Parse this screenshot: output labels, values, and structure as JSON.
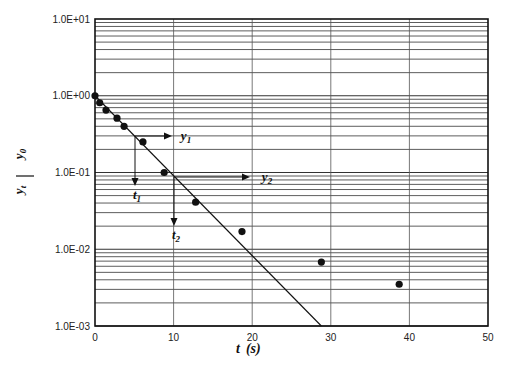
{
  "chart_data": {
    "type": "scatter",
    "title": "",
    "xlabel": "t (s)",
    "ylabel": "y_t / y_0",
    "xscale": "linear",
    "yscale": "log",
    "xlim": [
      0,
      50
    ],
    "ylim": [
      0.001,
      10
    ],
    "grid": true,
    "legend": null,
    "x_ticks": [
      "0",
      "10",
      "20",
      "30",
      "40",
      "50"
    ],
    "y_ticks": [
      "1.0E-03",
      "1.0E-02",
      "1.0E-01",
      "1.0E+00",
      "1.0E+01"
    ],
    "series": [
      {
        "name": "measured",
        "kind": "scatter",
        "x": [
          0,
          0.6,
          1.4,
          2.8,
          3.7,
          6.1,
          8.8,
          12.8,
          18.7,
          28.8,
          38.7
        ],
        "y": [
          1.0,
          0.81,
          0.65,
          0.51,
          0.4,
          0.25,
          0.1,
          0.041,
          0.017,
          0.0068,
          0.0035
        ]
      },
      {
        "name": "fitted line",
        "kind": "line",
        "x": [
          0,
          28.8
        ],
        "y": [
          1.0,
          0.001
        ]
      }
    ],
    "annotations": [
      {
        "label": "y",
        "sub": "1",
        "type": "horizontal-arrow",
        "y": 0.3
      },
      {
        "label": "t",
        "sub": "1",
        "type": "vertical-arrow",
        "x": 5.1
      },
      {
        "label": "y",
        "sub": "2",
        "type": "horizontal-arrow",
        "y": 0.092
      },
      {
        "label": "t",
        "sub": "2",
        "type": "vertical-arrow",
        "x": 10.1
      }
    ]
  },
  "labels": {
    "x_axis": "t",
    "x_unit": "(s)",
    "y_num": "y",
    "y_num_sub": "t",
    "y_den": "y",
    "y_den_sub": "0",
    "ann_y": "y",
    "ann_t": "t",
    "sub1": "1",
    "sub2": "2"
  }
}
